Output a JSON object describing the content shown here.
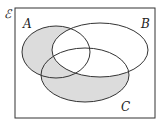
{
  "diagram": {
    "type": "venn",
    "universal_label": "ℰ",
    "sets": [
      {
        "label": "A",
        "cx": 56,
        "cy": 52,
        "rx": 34,
        "ry": 26
      },
      {
        "label": "B",
        "cx": 100,
        "cy": 50,
        "rx": 48,
        "ry": 27
      },
      {
        "label": "C",
        "cx": 85,
        "cy": 75,
        "rx": 44,
        "ry": 27
      }
    ],
    "shaded_region": "(A ∪ C) ∩ B'",
    "colors": {
      "shade": "#dcdcdc",
      "stroke": "#333333",
      "background": "#ffffff"
    }
  }
}
